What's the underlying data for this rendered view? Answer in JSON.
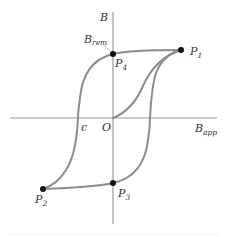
{
  "figure": {
    "axes": {
      "y_label": "B",
      "x_label_main": "B",
      "x_label_sub": "app",
      "origin_label": "O"
    },
    "labels": {
      "remanence_main": "B",
      "remanence_sub": "rem",
      "coercive": "c"
    },
    "points": [
      {
        "id": "P1",
        "main": "P",
        "sub": "1"
      },
      {
        "id": "P2",
        "main": "P",
        "sub": "2"
      },
      {
        "id": "P3",
        "main": "P",
        "sub": "3"
      },
      {
        "id": "P4",
        "main": "P",
        "sub": "4"
      }
    ],
    "colors": {
      "curve": "#8c8c8c",
      "axis": "#9a9a9a",
      "point": "#111111",
      "text": "#333333"
    }
  }
}
